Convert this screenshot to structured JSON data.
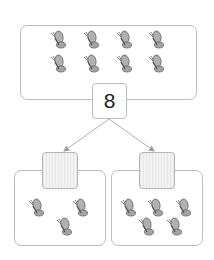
{
  "diagram": {
    "type": "number-bond",
    "whole": {
      "value": "8",
      "butterfly_count": 8
    },
    "parts": [
      {
        "value": "",
        "butterfly_count": 3,
        "blank": true
      },
      {
        "value": "",
        "butterfly_count": 5,
        "blank": true
      }
    ]
  },
  "colors": {
    "border": "#bdbdbd",
    "butterfly": "#a8a8a8",
    "line": "#b0b0b0"
  },
  "icons": {
    "butterfly": "butterfly-icon"
  }
}
